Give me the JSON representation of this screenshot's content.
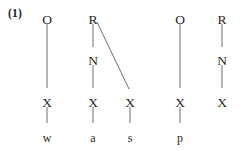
{
  "figure": {
    "example_number": "(1)",
    "type": "syllable-structure-tree",
    "ink_color": "#1f1f1f",
    "line_color": "#6f6f72",
    "background_color": "#ffffff"
  },
  "tiers": {
    "constituent_label": "constituent",
    "skeleton_label": "X",
    "segment_label": "segment"
  },
  "nodes": [
    {
      "id": "o1",
      "label": "O",
      "tier": "onset",
      "x": 47,
      "y": 13
    },
    {
      "id": "r1",
      "label": "R",
      "tier": "rhyme",
      "x": 93,
      "y": 13
    },
    {
      "id": "o2",
      "label": "O",
      "tier": "onset",
      "x": 180,
      "y": 13
    },
    {
      "id": "r2",
      "label": "R",
      "tier": "rhyme",
      "x": 222,
      "y": 13
    },
    {
      "id": "n1",
      "label": "N",
      "tier": "nucleus",
      "x": 93,
      "y": 54
    },
    {
      "id": "n2",
      "label": "N",
      "tier": "nucleus",
      "x": 222,
      "y": 54
    },
    {
      "id": "x1",
      "label": "X",
      "tier": "skeleton",
      "x": 47,
      "y": 96
    },
    {
      "id": "x2",
      "label": "X",
      "tier": "skeleton",
      "x": 93,
      "y": 96
    },
    {
      "id": "x3",
      "label": "X",
      "tier": "skeleton",
      "x": 130,
      "y": 96
    },
    {
      "id": "x4",
      "label": "X",
      "tier": "skeleton",
      "x": 180,
      "y": 96
    },
    {
      "id": "x5",
      "label": "X",
      "tier": "skeleton",
      "x": 222,
      "y": 96
    },
    {
      "id": "s1",
      "label": "w",
      "tier": "segment",
      "x": 47,
      "y": 131
    },
    {
      "id": "s2",
      "label": "a",
      "tier": "segment",
      "x": 93,
      "y": 131
    },
    {
      "id": "s3",
      "label": "s",
      "tier": "segment",
      "x": 130,
      "y": 131
    },
    {
      "id": "s4",
      "label": "p",
      "tier": "segment",
      "x": 180,
      "y": 131
    }
  ],
  "edges": [
    {
      "id": "e-o1-x1",
      "from": "o1",
      "to": "x1",
      "kind": "vertical",
      "x1": 47,
      "y1": 24,
      "x2": 47,
      "y2": 88
    },
    {
      "id": "e-r1-n1",
      "from": "r1",
      "to": "n1",
      "kind": "vertical",
      "x1": 93,
      "y1": 24,
      "x2": 93,
      "y2": 47
    },
    {
      "id": "e-n1-x2",
      "from": "n1",
      "to": "x2",
      "kind": "vertical",
      "x1": 93,
      "y1": 65,
      "x2": 93,
      "y2": 88
    },
    {
      "id": "e-r1-x3",
      "from": "r1",
      "to": "x3",
      "kind": "diagonal",
      "x1": 97,
      "y1": 22,
      "x2": 129,
      "y2": 89
    },
    {
      "id": "e-o2-x4",
      "from": "o2",
      "to": "x4",
      "kind": "vertical",
      "x1": 180,
      "y1": 24,
      "x2": 180,
      "y2": 88
    },
    {
      "id": "e-r2-n2",
      "from": "r2",
      "to": "n2",
      "kind": "vertical",
      "x1": 222,
      "y1": 24,
      "x2": 222,
      "y2": 47
    },
    {
      "id": "e-n2-x5",
      "from": "n2",
      "to": "x5",
      "kind": "vertical",
      "x1": 222,
      "y1": 65,
      "x2": 222,
      "y2": 88
    },
    {
      "id": "e-x1-s1",
      "from": "x1",
      "to": "s1",
      "kind": "vertical",
      "x1": 47,
      "y1": 107,
      "x2": 47,
      "y2": 123
    },
    {
      "id": "e-x2-s2",
      "from": "x2",
      "to": "s2",
      "kind": "vertical",
      "x1": 93,
      "y1": 107,
      "x2": 93,
      "y2": 123
    },
    {
      "id": "e-x3-s3",
      "from": "x3",
      "to": "s3",
      "kind": "vertical",
      "x1": 130,
      "y1": 107,
      "x2": 130,
      "y2": 123
    },
    {
      "id": "e-x4-s4",
      "from": "x4",
      "to": "s4",
      "kind": "vertical",
      "x1": 180,
      "y1": 107,
      "x2": 180,
      "y2": 123
    }
  ]
}
